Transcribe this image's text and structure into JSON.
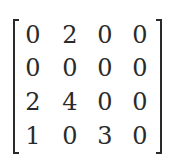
{
  "matrix": {
    "rows": [
      [
        "0",
        "2",
        "0",
        "0"
      ],
      [
        "0",
        "0",
        "0",
        "0"
      ],
      [
        "2",
        "4",
        "0",
        "0"
      ],
      [
        "1",
        "0",
        "3",
        "0"
      ]
    ]
  }
}
